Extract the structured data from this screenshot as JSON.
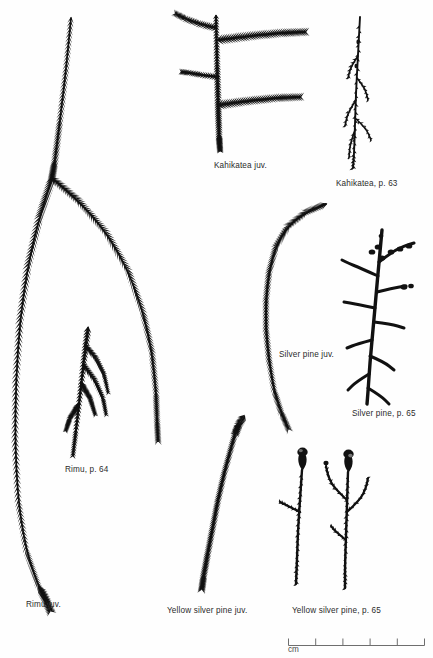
{
  "plate": {
    "title": "New Zealand conifer foliage identification plate",
    "background_color": "#fefefe",
    "ink_color": "#111111",
    "width": 433,
    "height": 658
  },
  "specimens": [
    {
      "id": "rimu-juv",
      "label": "Rimu juv.",
      "label_x": 26,
      "label_y": 601,
      "form": "weeping",
      "description": "Large drooping juvenile spray with long pendulous needle-clad branchlets"
    },
    {
      "id": "rimu-adult",
      "label": "Rimu, p. 64",
      "label_x": 65,
      "label_y": 466,
      "form": "adult-spray",
      "description": "Small adult branchlet with short scale-like leaves"
    },
    {
      "id": "kahikatea-juv",
      "label": "Kahikatea juv.",
      "label_x": 214,
      "label_y": 162,
      "form": "pinnate",
      "description": "Erect stem with four horizontal feathery juvenile branches"
    },
    {
      "id": "kahikatea-adult",
      "label": "Kahikatea, p. 63",
      "label_x": 336,
      "label_y": 180,
      "form": "slender-twig",
      "description": "Slender adult twig bearing tiny appressed scale leaves"
    },
    {
      "id": "silver-pine-juv",
      "label": "Silver pine juv.",
      "label_x": 279,
      "label_y": 351,
      "form": "arching-shoot",
      "description": "Single arching shoot clothed with spreading needles"
    },
    {
      "id": "silver-pine-adult",
      "label": "Silver pine, p. 65",
      "label_x": 352,
      "label_y": 410,
      "form": "branched-cones",
      "description": "Stout branched adult twig with clustered cones at tips"
    },
    {
      "id": "yellow-silver-pine-juv",
      "label": "Yellow silver pine juv.",
      "label_x": 167,
      "label_y": 607,
      "form": "curved-shoot",
      "description": "Curved juvenile shoot densely set with short needles"
    },
    {
      "id": "yellow-silver-pine-adult",
      "label": "Yellow silver pine, p. 65",
      "label_x": 292,
      "label_y": 607,
      "form": "twin-stems-with-seeds",
      "description": "Two adult stems with scale leaves and terminal seed with aril"
    }
  ],
  "scale_bar": {
    "unit_label": "cm",
    "unit_label_x": 288,
    "unit_label_y": 645,
    "x": 288,
    "y": 638,
    "width": 136,
    "ticks": 6,
    "intervals": 5,
    "tick_height": 7,
    "color": "#6e6e6e"
  }
}
